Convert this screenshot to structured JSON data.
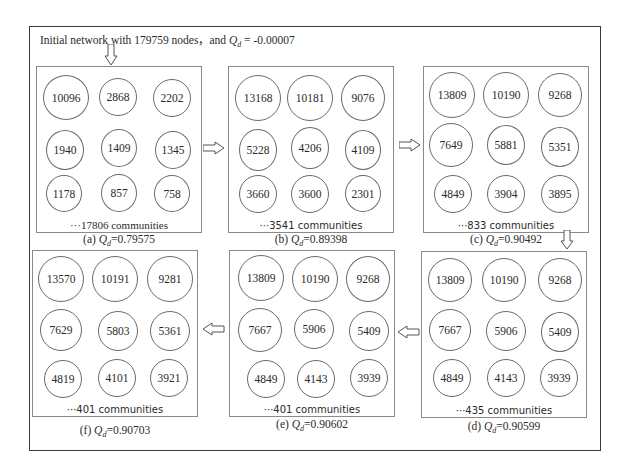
{
  "figure": {
    "title_prefix": "Initial network with 179759 nodes，and ",
    "title_q": "Q",
    "title_sub": "d",
    "title_value": " = -0.00007"
  },
  "panels": [
    {
      "id": "a",
      "label": "(a) ",
      "q_value": "=0.79575",
      "communities": "···17806 communities",
      "nodes": [
        "10096",
        "2868",
        "2202",
        "1940",
        "1409",
        "1345",
        "1178",
        "857",
        "758"
      ]
    },
    {
      "id": "b",
      "label": "(b) ",
      "q_value": "=0.89398",
      "communities": "···3541 communities",
      "nodes": [
        "13168",
        "10181",
        "9076",
        "5228",
        "4206",
        "4109",
        "3660",
        "3600",
        "2301"
      ]
    },
    {
      "id": "c",
      "label": "(c) ",
      "q_value": "=0.90492",
      "communities": "···833 communities",
      "nodes": [
        "13809",
        "10190",
        "9268",
        "7649",
        "5881",
        "5351",
        "4849",
        "3904",
        "3895"
      ]
    },
    {
      "id": "d",
      "label": "(d) ",
      "q_value": "=0.90599",
      "communities": "···435 communities",
      "nodes": [
        "13809",
        "10190",
        "9268",
        "7667",
        "5906",
        "5409",
        "4849",
        "4143",
        "3939"
      ]
    },
    {
      "id": "e",
      "label": "(e) ",
      "q_value": "=0.90602",
      "communities": "···401 communities",
      "nodes": [
        "13809",
        "10190",
        "9268",
        "7667",
        "5906",
        "5409",
        "4849",
        "4143",
        "3939"
      ]
    },
    {
      "id": "f",
      "label": "(f) ",
      "q_value": "=0.90703",
      "communities": "···401 communities",
      "nodes": [
        "13570",
        "10191",
        "9281",
        "7629",
        "5803",
        "5361",
        "4819",
        "4101",
        "3921"
      ]
    }
  ],
  "q_symbol": "Q",
  "q_subscript": "d"
}
